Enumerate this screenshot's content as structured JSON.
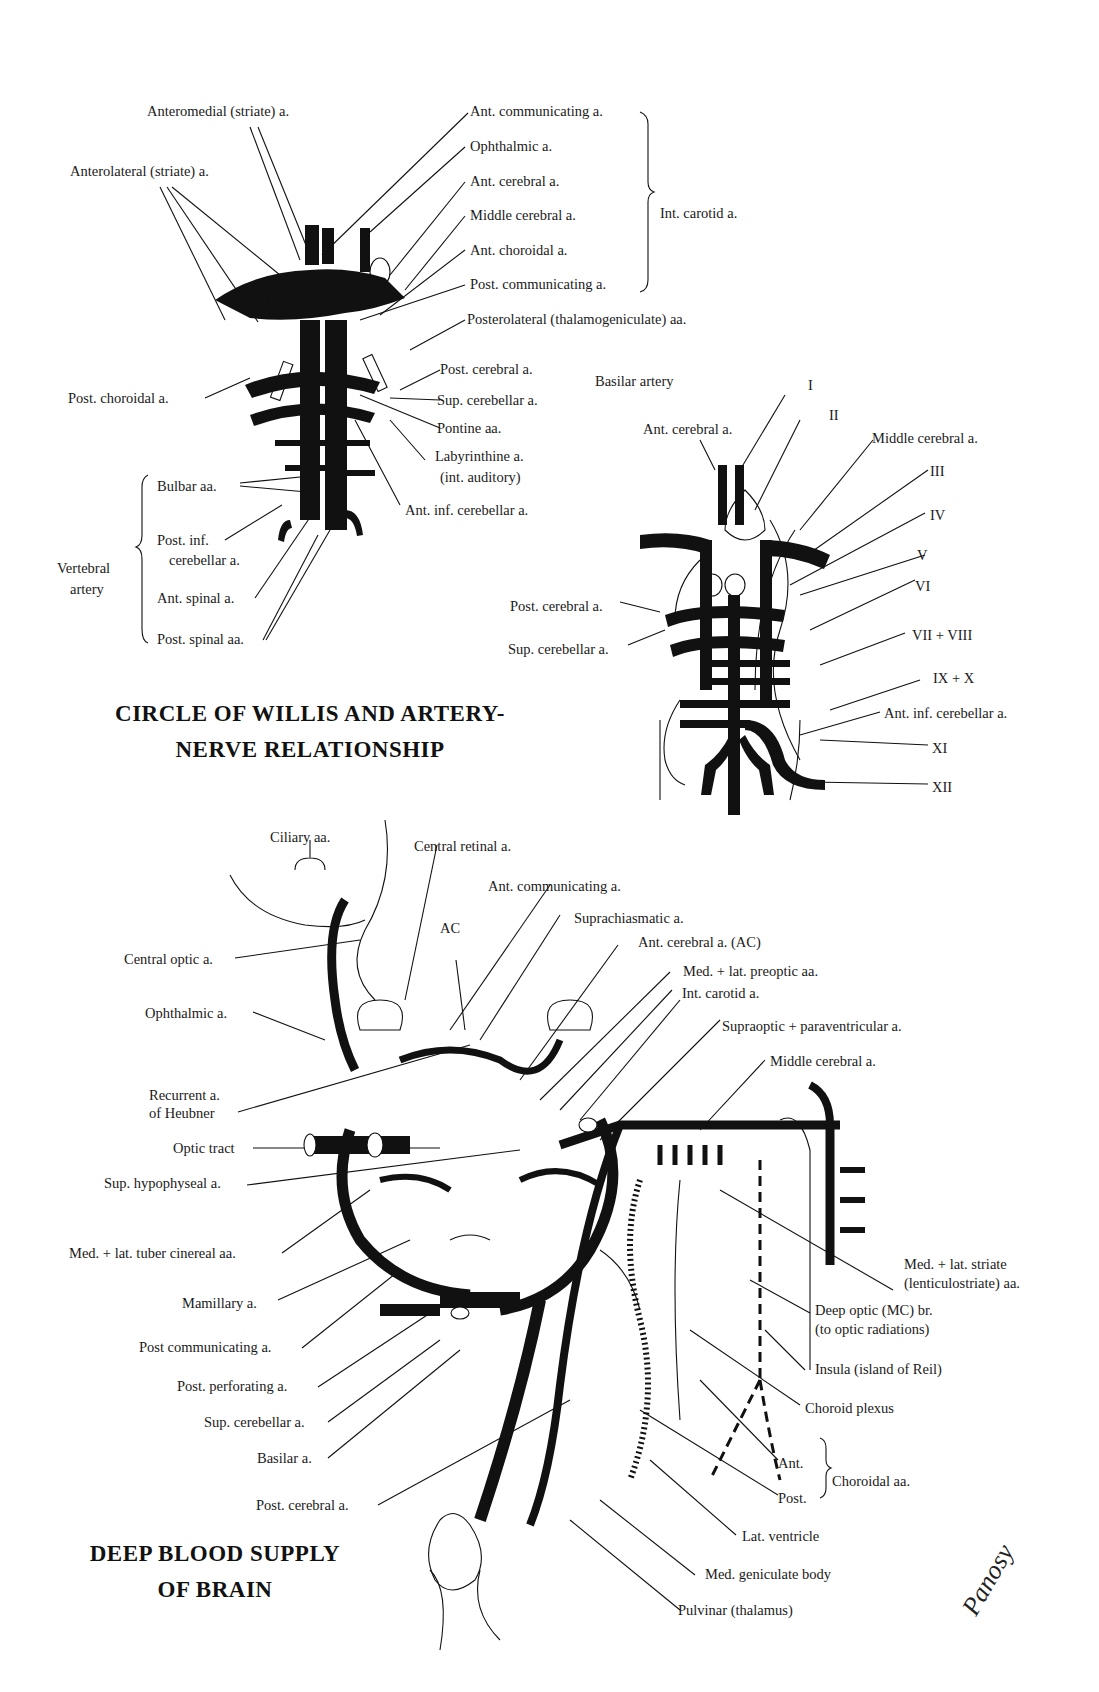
{
  "circle_of_willis": {
    "title_line1": "CIRCLE OF WILLIS AND ARTERY-",
    "title_line2": "NERVE RELATIONSHIP",
    "left_labels": {
      "anteromedial": "Anteromedial (striate) a.",
      "anterolateral": "Anterolateral (striate) a.",
      "post_choroidal": "Post. choroidal a."
    },
    "int_carotid_group": {
      "items": [
        "Ant. communicating a.",
        "Ophthalmic a.",
        "Ant. cerebral a.",
        "Middle cerebral a.",
        "Ant. choroidal a.",
        "Post. communicating a."
      ],
      "bracket_label": "Int. carotid a."
    },
    "right_labels": {
      "posterolateral": "Posterolateral (thalamogeniculate) aa.",
      "post_cerebral": "Post. cerebral a.",
      "sup_cerebellar": "Sup. cerebellar a.",
      "pontine": "Pontine aa.",
      "labyrinthine_1": "Labyrinthine a.",
      "labyrinthine_2": "(int. auditory)",
      "ant_inf_cerebellar": "Ant. inf. cerebellar a."
    },
    "vertebral_group": {
      "label_1": "Vertebral",
      "label_2": "artery",
      "items": [
        "Bulbar aa.",
        "Post. inf.",
        "cerebellar a.",
        "Ant. spinal a.",
        "Post. spinal aa."
      ]
    }
  },
  "artery_nerve": {
    "basilar_artery": "Basilar artery",
    "ant_cerebral": "Ant. cerebral a.",
    "middle_cerebral": "Middle cerebral a.",
    "post_cerebral": "Post. cerebral a.",
    "sup_cerebellar": "Sup. cerebellar a.",
    "ant_inf_cerebellar": "Ant. inf. cerebellar a.",
    "nerves": [
      "I",
      "II",
      "III",
      "IV",
      "V",
      "VI",
      "VII + VIII",
      "IX + X",
      "XI",
      "XII"
    ]
  },
  "deep_supply": {
    "title_line1": "DEEP BLOOD SUPPLY",
    "title_line2": "OF BRAIN",
    "top_labels": {
      "ciliary": "Ciliary aa.",
      "central_retinal": "Central retinal a.",
      "ant_communicating": "Ant. communicating a.",
      "ac": "AC",
      "suprachiasmatic": "Suprachiasmatic a.",
      "ant_cerebral_ac": "Ant. cerebral a. (AC)",
      "preoptic": "Med. + lat. preoptic aa.",
      "int_carotid": "Int. carotid a.",
      "supraoptic": "Supraoptic + paraventricular a.",
      "middle_cerebral": "Middle cerebral a."
    },
    "left_labels": {
      "central_optic": "Central optic a.",
      "ophthalmic": "Ophthalmic a.",
      "recurrent_1": "Recurrent a.",
      "recurrent_2": "of Heubner",
      "optic_tract": "Optic tract",
      "sup_hypophyseal": "Sup. hypophyseal a.",
      "tuber_cinereal": "Med. + lat. tuber cinereal aa.",
      "mamillary": "Mamillary a.",
      "post_communicating": "Post communicating a.",
      "post_perforating": "Post. perforating a.",
      "sup_cerebellar": "Sup. cerebellar a.",
      "basilar": "Basilar a.",
      "post_cerebral": "Post. cerebral a."
    },
    "right_labels": {
      "striate_1": "Med. + lat. striate",
      "striate_2": "(lenticulostriate) aa.",
      "deep_optic_1": "Deep optic (MC) br.",
      "deep_optic_2": "(to optic radiations)",
      "insula": "Insula (island of Reil)",
      "choroid_plexus": "Choroid plexus",
      "choroidal_ant": "Ant.",
      "choroidal_post": "Post.",
      "choroidal_group": "Choroidal aa.",
      "lat_ventricle": "Lat. ventricle",
      "med_geniculate": "Med. geniculate body",
      "pulvinar": "Pulvinar (thalamus)"
    },
    "signature": "Panosy"
  }
}
